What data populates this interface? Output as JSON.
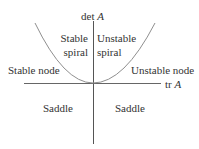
{
  "diagram": {
    "type": "trace-determinant plane",
    "axes": {
      "vertical_label": "det",
      "vertical_var": "A",
      "horizontal_label": "tr",
      "horizontal_var": "A"
    },
    "regions": {
      "stable_spiral": {
        "line1": "Stable",
        "line2": "spiral"
      },
      "unstable_spiral": {
        "line1": "Unstable",
        "line2": "spiral"
      },
      "stable_node": "Stable node",
      "unstable_node": "Unstable node",
      "saddle_left": "Saddle",
      "saddle_right": "Saddle"
    },
    "colors": {
      "axis": "#555555",
      "curve": "#8a8a8a",
      "text": "#333333"
    }
  }
}
